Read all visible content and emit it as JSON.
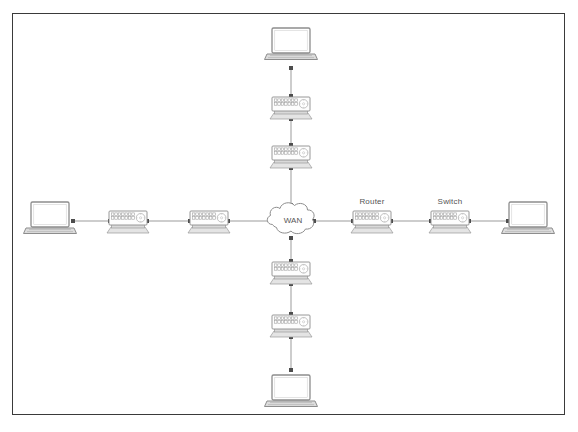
{
  "diagram": {
    "frame": {
      "border_color": "#3a3a3a",
      "background": "#ffffff"
    },
    "palette": {
      "device_outline": "#8d8d8d",
      "device_fill": "#fdfdfd",
      "device_shade": "#e9e9e9",
      "port_outline": "#9a9a9a",
      "link_color": "#9b9b9b",
      "endpoint_color": "#4d4d4d",
      "label_color": "#555555",
      "laptop_outline": "#8d8d8d",
      "laptop_screen": "#ffffff",
      "laptop_base": "#d8d8d8",
      "cloud_outline": "#8d8d8d"
    },
    "cloud": {
      "name": "wan-cloud",
      "label": "WAN",
      "cx": 293,
      "cy": 221
    },
    "labels": [
      {
        "name": "router-label",
        "text": "Router",
        "x": 372,
        "y": 202
      },
      {
        "name": "switch-label",
        "text": "Switch",
        "x": 450,
        "y": 202
      }
    ],
    "laptops": [
      {
        "name": "laptop-top",
        "position": "top",
        "cx": 291,
        "cy": 44,
        "connector_side": "bottom"
      },
      {
        "name": "laptop-left",
        "position": "left",
        "cx": 50,
        "cy": 218,
        "connector_side": "right"
      },
      {
        "name": "laptop-right",
        "position": "right",
        "cx": 528,
        "cy": 218,
        "connector_side": "left"
      },
      {
        "name": "laptop-bottom",
        "position": "bottom",
        "cx": 291,
        "cy": 391,
        "connector_side": "top"
      }
    ],
    "switches": [
      {
        "name": "switch-top-outer",
        "cx": 291,
        "cy": 107,
        "orientation": "horizontal",
        "label": ""
      },
      {
        "name": "switch-top-inner",
        "cx": 291,
        "cy": 156,
        "orientation": "horizontal",
        "label": ""
      },
      {
        "name": "switch-left-outer",
        "cx": 128,
        "cy": 221,
        "orientation": "horizontal",
        "label": ""
      },
      {
        "name": "switch-left-inner",
        "cx": 209,
        "cy": 221,
        "orientation": "horizontal",
        "label": ""
      },
      {
        "name": "router-right-inner",
        "cx": 372,
        "cy": 221,
        "orientation": "horizontal",
        "label": "Router"
      },
      {
        "name": "switch-right-outer",
        "cx": 450,
        "cy": 221,
        "orientation": "horizontal",
        "label": "Switch"
      },
      {
        "name": "switch-bottom-inner",
        "cx": 291,
        "cy": 272,
        "orientation": "horizontal",
        "label": ""
      },
      {
        "name": "switch-bottom-outer",
        "cx": 291,
        "cy": 325,
        "orientation": "horizontal",
        "label": ""
      }
    ],
    "links": [
      {
        "name": "link-laptop-top-to-switch",
        "x1": 291,
        "y1": 68,
        "x2": 291,
        "y2": 96
      },
      {
        "name": "link-switch-top-outer-to-inner",
        "x1": 291,
        "y1": 119,
        "x2": 291,
        "y2": 145
      },
      {
        "name": "link-switch-top-inner-to-wan",
        "x1": 291,
        "y1": 168,
        "x2": 291,
        "y2": 205
      },
      {
        "name": "link-laptop-left-to-switch",
        "x1": 73,
        "y1": 221,
        "x2": 110,
        "y2": 221
      },
      {
        "name": "link-switch-left-outer-to-inner",
        "x1": 147,
        "y1": 221,
        "x2": 190,
        "y2": 221
      },
      {
        "name": "link-switch-left-inner-to-wan",
        "x1": 228,
        "y1": 221,
        "x2": 272,
        "y2": 221
      },
      {
        "name": "link-wan-to-router",
        "x1": 314,
        "y1": 221,
        "x2": 353,
        "y2": 221
      },
      {
        "name": "link-router-to-switch-right",
        "x1": 391,
        "y1": 221,
        "x2": 431,
        "y2": 221
      },
      {
        "name": "link-switch-right-to-laptop",
        "x1": 469,
        "y1": 221,
        "x2": 508,
        "y2": 221
      },
      {
        "name": "link-wan-to-switch-bottom-inner",
        "x1": 291,
        "y1": 238,
        "x2": 291,
        "y2": 261
      },
      {
        "name": "link-switch-bottom-inner-to-outer",
        "x1": 291,
        "y1": 284,
        "x2": 291,
        "y2": 314
      },
      {
        "name": "link-switch-bottom-outer-to-laptop",
        "x1": 291,
        "y1": 337,
        "x2": 291,
        "y2": 370
      }
    ]
  }
}
